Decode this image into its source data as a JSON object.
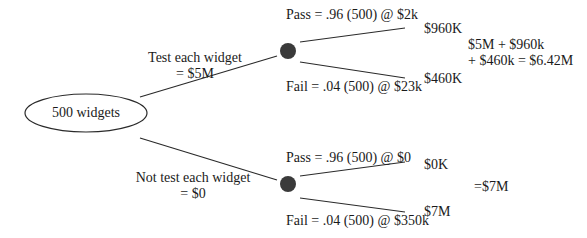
{
  "root": {
    "label": "500 widgets"
  },
  "branches": [
    {
      "decision_line1": "Test each widget",
      "decision_line2": "= $5M",
      "outcomes": [
        {
          "label": "Pass = .96 (500) @ $2k",
          "value": "$960K"
        },
        {
          "label": "Fail = .04 (500) @ $23k",
          "value": "$460K"
        }
      ],
      "total_line1": "$5M + $960k",
      "total_line2": "+ $460k = $6.42M"
    },
    {
      "decision_line1": "Not test each widget",
      "decision_line2": "= $0",
      "outcomes": [
        {
          "label": "Pass = .96 (500) @ $0",
          "value": "$0K"
        },
        {
          "label": "Fail = .04 (500) @ $350k",
          "value": "$7M"
        }
      ],
      "total_line1": "=$7M"
    }
  ],
  "colors": {
    "line": "#2a2a2a",
    "node_fill": "#3a3a3a"
  }
}
